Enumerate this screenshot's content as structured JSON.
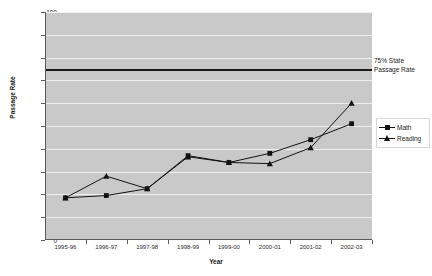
{
  "chart_data": {
    "type": "line",
    "title": "",
    "xlabel": "Year",
    "ylabel": "Passage Rate",
    "categories": [
      "1995-96",
      "1996-97",
      "1997-98",
      "1998-99",
      "1999-00",
      "2000-01",
      "2001-02",
      "2002-03"
    ],
    "series": [
      {
        "name": "Math",
        "marker": "square",
        "color": "#121212",
        "values": [
          18.5,
          19.5,
          22.5,
          37,
          34,
          38,
          44,
          51
        ]
      },
      {
        "name": "Reading",
        "marker": "triangle",
        "color": "#121212",
        "values": [
          18.5,
          28,
          22.5,
          36.5,
          34,
          33.5,
          40.5,
          60
        ]
      }
    ],
    "ylim": [
      0,
      100
    ],
    "yticks": [
      0,
      10,
      20,
      30,
      40,
      50,
      60,
      70,
      80,
      90,
      100
    ],
    "ytick_labels": [
      "0",
      "10",
      "20",
      "30",
      "40",
      "50",
      "60",
      "70",
      "80",
      "90",
      "100"
    ],
    "grid": true,
    "legend_position": "right",
    "reference_lines": [
      {
        "value": 74.5,
        "label": "75% State Passage Rate",
        "label_line1": "75% State",
        "label_line2": "Passage Rate",
        "color": "#1a1a1a"
      }
    ],
    "plot_background": "#c9c9c9",
    "gridline_color": "#efefef",
    "axis_color": "#5a5a5a"
  }
}
